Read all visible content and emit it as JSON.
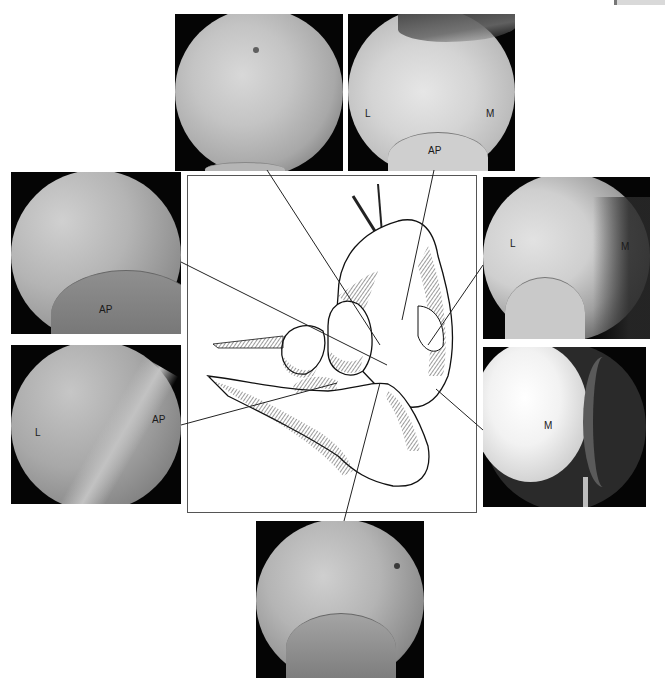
{
  "figure": {
    "type": "arthroscopy-montage",
    "center": "line drawing of ankle / subtalar joint anatomy with leader lines to arthroscopic views",
    "panels": [
      {
        "id": "top-left",
        "labels": []
      },
      {
        "id": "top-right",
        "labels": [
          "L",
          "M",
          "AP"
        ]
      },
      {
        "id": "left-upper",
        "labels": [
          "AP"
        ]
      },
      {
        "id": "left-lower",
        "labels": [
          "L",
          "AP"
        ]
      },
      {
        "id": "right-upper",
        "labels": [
          "L",
          "M"
        ]
      },
      {
        "id": "right-lower",
        "labels": [
          "M"
        ]
      },
      {
        "id": "bottom",
        "labels": []
      }
    ]
  },
  "labels": {
    "tr_L": "L",
    "tr_M": "M",
    "tr_AP": "AP",
    "lu_AP": "AP",
    "ll_L": "L",
    "ll_AP": "AP",
    "ru_L": "L",
    "ru_M": "M",
    "rl_M": "M"
  }
}
